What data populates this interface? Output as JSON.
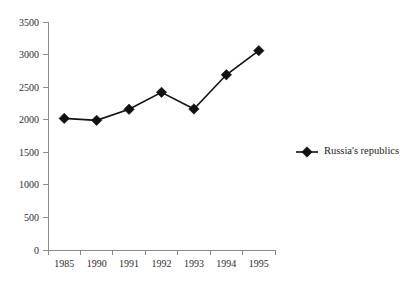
{
  "chart_data": {
    "type": "line",
    "title": "",
    "subtitle": "",
    "xlabel": "",
    "ylabel": "",
    "categories": [
      "1985",
      "1990",
      "1991",
      "1992",
      "1993",
      "1994",
      "1995"
    ],
    "x_tick_labels": [
      "1985",
      "1990",
      "1991",
      "1992",
      "1993",
      "1994",
      "1995"
    ],
    "y_tick_labels": [
      "0",
      "500",
      "1000",
      "1500",
      "2000",
      "2500",
      "3000",
      "3500"
    ],
    "y_tick_values": [
      0,
      500,
      1000,
      1500,
      2000,
      2500,
      3000,
      3500
    ],
    "ylim": [
      0,
      3500
    ],
    "grid": false,
    "legend_position": "right",
    "series": [
      {
        "name": "Russia's republics",
        "marker": "diamond",
        "color": "#111111",
        "values": [
          2020,
          1990,
          2160,
          2420,
          2165,
          2690,
          3060
        ]
      }
    ]
  },
  "legend": {
    "entries": [
      {
        "label": "Russia's republics",
        "marker": "diamond-marker",
        "color": "#111111"
      }
    ]
  },
  "axes": {
    "y_axis_name": "y-axis",
    "x_axis_name": "x-axis"
  },
  "colors": {
    "series": "#111111",
    "axis": "#8a8a8a",
    "text": "#1a1a1a",
    "background": "#ffffff"
  }
}
